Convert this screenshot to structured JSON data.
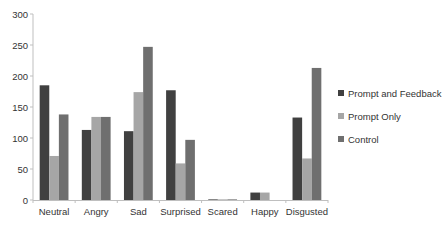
{
  "chart_data": {
    "type": "bar",
    "title": "",
    "xlabel": "",
    "ylabel": "",
    "ylim": [
      0,
      300
    ],
    "yticks": [
      0,
      50,
      100,
      150,
      200,
      250,
      300
    ],
    "grid": false,
    "legend_position": "right",
    "categories": [
      "Neutral",
      "Angry",
      "Sad",
      "Surprised",
      "Scared",
      "Happy",
      "Disgusted"
    ],
    "series": [
      {
        "name": "Prompt and Feedback",
        "color": "#404040",
        "values": [
          185,
          113,
          111,
          177,
          1,
          12,
          133
        ]
      },
      {
        "name": "Prompt Only",
        "color": "#a6a6a6",
        "values": [
          71,
          134,
          174,
          59,
          1,
          12,
          67
        ]
      },
      {
        "name": "Control",
        "color": "#6f6f6f",
        "values": [
          138,
          134,
          247,
          97,
          1,
          0,
          213
        ]
      }
    ]
  },
  "legend": {
    "items": [
      {
        "label": "Prompt and Feedback",
        "color": "#404040"
      },
      {
        "label": "Prompt Only",
        "color": "#a6a6a6"
      },
      {
        "label": "Control",
        "color": "#6f6f6f"
      }
    ]
  }
}
